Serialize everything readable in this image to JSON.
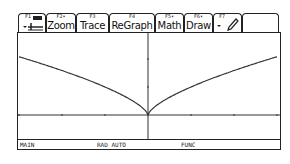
{
  "toolbar": {
    "tabs": [
      {
        "fkey": "F1",
        "label": "",
        "icon": "tools-icon"
      },
      {
        "fkey": "F2▾",
        "label": "Zoom"
      },
      {
        "fkey": "F3",
        "label": "Trace"
      },
      {
        "fkey": "F4",
        "label": "ReGraph"
      },
      {
        "fkey": "F5▾",
        "label": "Math"
      },
      {
        "fkey": "F6▾",
        "label": "Draw"
      },
      {
        "fkey": "F7",
        "label": "",
        "icon": "pencil-icon"
      },
      {
        "fkey": "",
        "label": ""
      }
    ]
  },
  "status": {
    "folder": "MAIN",
    "mode": "RAD AUTO",
    "graph_mode": "FUNC"
  },
  "chart_data": {
    "type": "line",
    "title": "",
    "function": "y = |x|^(2/3)",
    "xlabel": "",
    "ylabel": "",
    "xlim": [
      -3,
      3
    ],
    "ylim": [
      -0.85,
      2.9
    ],
    "xtick_spacing": 1,
    "ytick_spacing": 1,
    "grid": false,
    "series": [
      {
        "name": "y1",
        "x": [
          -3,
          -2.5,
          -2,
          -1.5,
          -1,
          -0.5,
          -0.25,
          0,
          0.25,
          0.5,
          1,
          1.5,
          2,
          2.5,
          3
        ],
        "y": [
          2.08,
          1.84,
          1.59,
          1.31,
          1.0,
          0.63,
          0.4,
          0,
          0.4,
          0.63,
          1.0,
          1.31,
          1.59,
          1.84,
          2.08
        ]
      }
    ]
  }
}
